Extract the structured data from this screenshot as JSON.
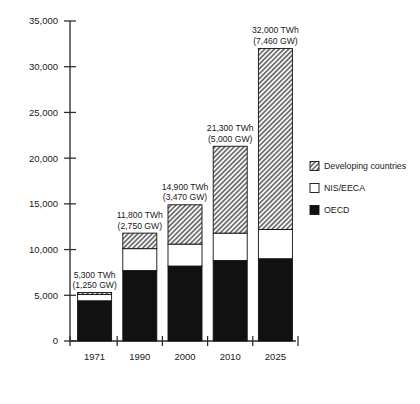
{
  "chart_data": {
    "type": "bar",
    "title": "",
    "subtitle": "",
    "xlabel": "",
    "ylabel": "",
    "stacked": true,
    "grid": false,
    "legend_position": "right",
    "categories": [
      "1971",
      "1990",
      "2000",
      "2010",
      "2025"
    ],
    "ylim": [
      0,
      35000
    ],
    "yticks": [
      0,
      5000,
      10000,
      15000,
      20000,
      25000,
      30000,
      35000
    ],
    "ytick_labels": [
      "0",
      "5,000",
      "10,000",
      "15,000",
      "20,000",
      "25,000",
      "30,000",
      "35,000"
    ],
    "series": [
      {
        "name": "OECD",
        "fill": "solid-black",
        "color": "#111111",
        "values": [
          4400,
          7700,
          8200,
          8800,
          9000
        ]
      },
      {
        "name": "NIS/EECA",
        "fill": "white",
        "color": "#ffffff",
        "values": [
          700,
          2400,
          2400,
          3000,
          3200
        ]
      },
      {
        "name": "Developing countries",
        "fill": "hatched",
        "color": "#b9b9b9",
        "values": [
          200,
          1700,
          4300,
          9500,
          19800
        ]
      }
    ],
    "annotations": [
      {
        "category": "1971",
        "line1": "5,300 TWh",
        "line2": "(1,250 GW)",
        "total": 5300,
        "capacity_gw": 1250
      },
      {
        "category": "1990",
        "line1": "11,800 TWh",
        "line2": "(2,750 GW)",
        "total": 11800,
        "capacity_gw": 2750
      },
      {
        "category": "2000",
        "line1": "14,900 TWh",
        "line2": "(3,470 GW)",
        "total": 14900,
        "capacity_gw": 3470
      },
      {
        "category": "2010",
        "line1": "21,300 TWh",
        "line2": "(5,000 GW)",
        "total": 21300,
        "capacity_gw": 5000
      },
      {
        "category": "2025",
        "line1": "32,000 TWh",
        "line2": "(7,460 GW)",
        "total": 32000,
        "capacity_gw": 7460
      }
    ]
  },
  "legend": {
    "items": [
      {
        "label": "Developing countries",
        "swatch": "hatched"
      },
      {
        "label": "NIS/EECA",
        "swatch": "white"
      },
      {
        "label": "OECD",
        "swatch": "black"
      }
    ]
  },
  "colors": {
    "oecd": "#111111",
    "nis_eeca": "#ffffff",
    "developing": "#b9b9b9",
    "axis": "#2b2b2b",
    "text": "#1a1a1a"
  }
}
